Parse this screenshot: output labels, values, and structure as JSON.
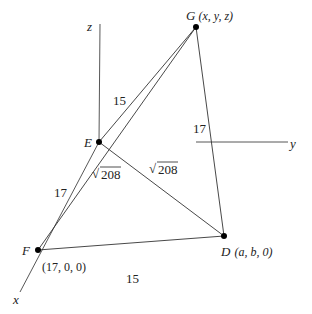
{
  "diagram": {
    "type": "3d-geometry-tetrahedron",
    "axes": {
      "x": {
        "label": "x"
      },
      "y": {
        "label": "y"
      },
      "z": {
        "label": "z"
      }
    },
    "points": {
      "G": {
        "name": "G",
        "coords": "(x, y, z)"
      },
      "E": {
        "name": "E",
        "coords": ""
      },
      "F": {
        "name": "F",
        "coords": "(17, 0, 0)"
      },
      "D": {
        "name": "D",
        "coords": "(a, b, 0)"
      }
    },
    "edges": [
      {
        "from": "E",
        "to": "G",
        "label": "15"
      },
      {
        "from": "G",
        "to": "D",
        "label": "17"
      },
      {
        "from": "F",
        "to": "E",
        "label": "17"
      },
      {
        "from": "F",
        "to": "G",
        "label": "√208"
      },
      {
        "from": "E",
        "to": "D",
        "label": "√208"
      },
      {
        "from": "F",
        "to": "D",
        "label": "15"
      }
    ],
    "labels": {
      "eg": "15",
      "gd": "17",
      "fe": "17",
      "fg_radicand": "208",
      "ed_radicand": "208",
      "fd": "15",
      "sqrt_symbol": "√"
    }
  }
}
